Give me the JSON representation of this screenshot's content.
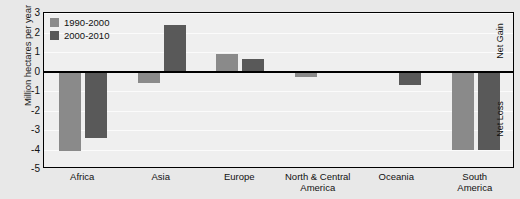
{
  "chart_data": {
    "type": "bar",
    "title": "",
    "subtitle": "",
    "xlabel": "",
    "ylabel": "Million hectares per year",
    "ylim": [
      -5,
      3
    ],
    "ytick_values": [
      3,
      2,
      1,
      0,
      -1,
      -2,
      -3,
      -4,
      -5
    ],
    "ytick_labels": [
      "3",
      "2",
      "1",
      "0",
      "-1",
      "-2",
      "-3",
      "-4",
      "-5"
    ],
    "grid": true,
    "legend_position": "top-left",
    "categories": [
      "Africa",
      "Asia",
      "Europe",
      "North & Central America",
      "Oceania",
      "South America"
    ],
    "category_label_lines": [
      [
        "Africa"
      ],
      [
        "Asia"
      ],
      [
        "Europe"
      ],
      [
        "North & Central",
        "America"
      ],
      [
        "Oceania"
      ],
      [
        "South",
        "America"
      ]
    ],
    "series": [
      {
        "name": "1990-2000",
        "color": "#8a8a8a",
        "values": [
          -4.1,
          -0.6,
          0.9,
          -0.3,
          null,
          -4.0
        ]
      },
      {
        "name": "2000-2010",
        "color": "#595959",
        "values": [
          -3.4,
          2.4,
          0.65,
          null,
          -0.7,
          -4.0
        ]
      }
    ],
    "annotations": [
      {
        "text": "Net Gain",
        "region": "above-zero",
        "orientation": "vertical"
      },
      {
        "text": "Net Loss",
        "region": "below-zero",
        "orientation": "vertical"
      }
    ],
    "colors": {
      "series_1990_2000": "#8a8a8a",
      "series_2000_2010": "#595959",
      "plot_background": "#efefef",
      "page_background": "#e8e8e8",
      "axis": "#000000",
      "gridline": "#fbfbfb"
    }
  }
}
